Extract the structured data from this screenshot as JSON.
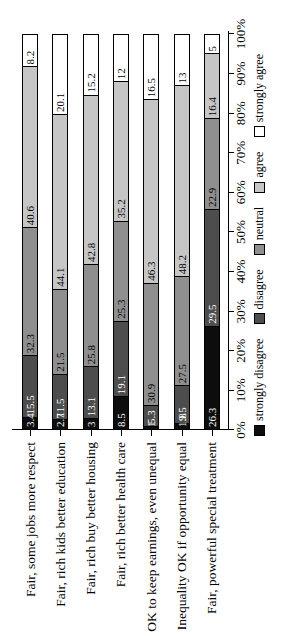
{
  "chart_data": {
    "type": "bar",
    "variant": "stacked-100-percent",
    "orientation": "horizontal, whole chart rotated 90deg counter-clockwise",
    "title": "",
    "xlabel": "",
    "ylabel": "",
    "unit": "%",
    "grid": false,
    "legend_position": "below-axis (right edge after rotation)",
    "axis": {
      "min": 0,
      "max": 100,
      "tick_step": 10,
      "tick_labels": [
        "0%",
        "10%",
        "20%",
        "30%",
        "40%",
        "50%",
        "60%",
        "70%",
        "80%",
        "90%",
        "100%"
      ]
    },
    "categories": [
      "Fair, some jobs more respect",
      "Fair, rich kids better education",
      "Fair, rich buy better housing",
      "Fair, rich better health care",
      "OK to keep earnings, even unequal",
      "Inequality OK if opportunity equal",
      "Fair, powerful special treatment"
    ],
    "series": [
      {
        "name": "strongly disagree",
        "color": "#0d0d0d",
        "label_color": "#ffffff",
        "values": [
          3.4,
          2.7,
          3,
          8.5,
          1,
          1.8,
          26.3
        ]
      },
      {
        "name": "disagree",
        "color": "#4d4d4d",
        "label_color": "#ffffff",
        "values": [
          15.5,
          11.5,
          13.1,
          19.1,
          5.3,
          9.5,
          29.5
        ]
      },
      {
        "name": "neutral",
        "color": "#8f8f8f",
        "label_color": "#000000",
        "values": [
          32.3,
          21.5,
          25.8,
          25.3,
          30.9,
          27.5,
          22.9
        ]
      },
      {
        "name": "agree",
        "color": "#c6c6c6",
        "label_color": "#000000",
        "values": [
          40.6,
          44.1,
          42.8,
          35.2,
          46.3,
          48.2,
          16.4
        ]
      },
      {
        "name": "strongly agree",
        "color": "#ffffff",
        "label_color": "#000000",
        "values": [
          8.2,
          20.1,
          15.2,
          12,
          16.5,
          13,
          5
        ]
      }
    ],
    "legend": [
      "strongly disagree",
      "disagree",
      "neutral",
      "agree",
      "strongly agree"
    ],
    "colors": {
      "strongly_disagree": "#0d0d0d",
      "disagree": "#4d4d4d",
      "neutral": "#8f8f8f",
      "agree": "#c6c6c6",
      "strongly_agree": "#ffffff",
      "axis": "#000000",
      "background": "#ffffff"
    }
  }
}
